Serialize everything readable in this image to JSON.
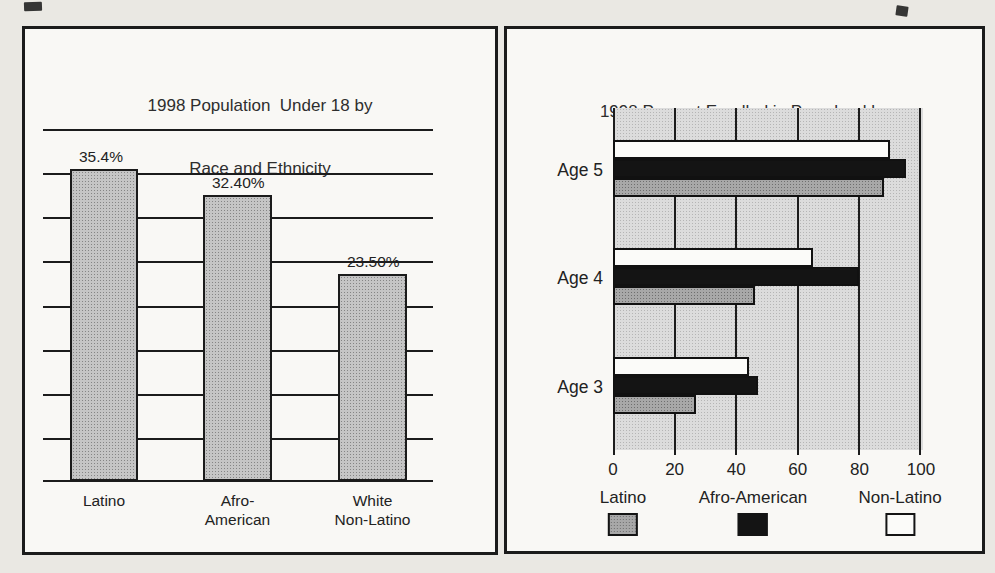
{
  "left_chart": {
    "title_line1": "1998 Population  Under 18 by",
    "title_line2": "Race and Ethnicity",
    "bars": [
      {
        "value_label": "35.4%",
        "cat_line1": "Latino",
        "cat_line2": ""
      },
      {
        "value_label": "32.40%",
        "cat_line1": "Afro-",
        "cat_line2": "American"
      },
      {
        "value_label": "23.50%",
        "cat_line1": "White",
        "cat_line2": "Non-Latino"
      }
    ]
  },
  "right_chart": {
    "title_line1": "1998 Percent Enrolled in Preschool by",
    "title_line2": "Race and Ethnicity",
    "age_labels": [
      "Age 5",
      "Age 4",
      "Age 3"
    ],
    "x_tick_labels": [
      "0",
      "20",
      "40",
      "60",
      "80",
      "100"
    ],
    "legend": [
      {
        "label": "Latino",
        "color": "#a8a8a8"
      },
      {
        "label": "Afro-American",
        "color": "#141414"
      },
      {
        "label": "Non-Latino",
        "color": "#fbfbf9"
      }
    ]
  },
  "chart_data": [
    {
      "type": "bar",
      "title": "1998 Population  Under 18 by Race and Ethnicity",
      "categories": [
        "Latino",
        "Afro-American",
        "White Non-Latino"
      ],
      "values": [
        35.4,
        32.4,
        23.5
      ],
      "value_labels": [
        "35.4%",
        "32.40%",
        "23.50%"
      ],
      "ylim": [
        0,
        40
      ],
      "gridline_step": 5,
      "grid": true,
      "y_tick_labels_shown": false,
      "bar_color": "#c5c5c5"
    },
    {
      "type": "bar",
      "orientation": "horizontal",
      "title": "1998 Percent Enrolled in Preschool by Race and Ethnicity",
      "categories": [
        "Age 5",
        "Age 4",
        "Age 3"
      ],
      "series": [
        {
          "name": "Latino",
          "color": "#a8a8a8",
          "values": [
            88,
            46,
            27
          ]
        },
        {
          "name": "Afro-American",
          "color": "#141414",
          "values": [
            95,
            80,
            47
          ]
        },
        {
          "name": "Non-Latino",
          "color": "#fbfbf9",
          "values": [
            90,
            65,
            44
          ]
        }
      ],
      "bar_order_top_to_bottom": [
        "Non-Latino",
        "Afro-American",
        "Latino"
      ],
      "xlim": [
        0,
        100
      ],
      "x_ticks": [
        0,
        20,
        40,
        60,
        80,
        100
      ],
      "grid": true,
      "plot_background": "#dcdcdc",
      "legend_position": "bottom"
    }
  ]
}
